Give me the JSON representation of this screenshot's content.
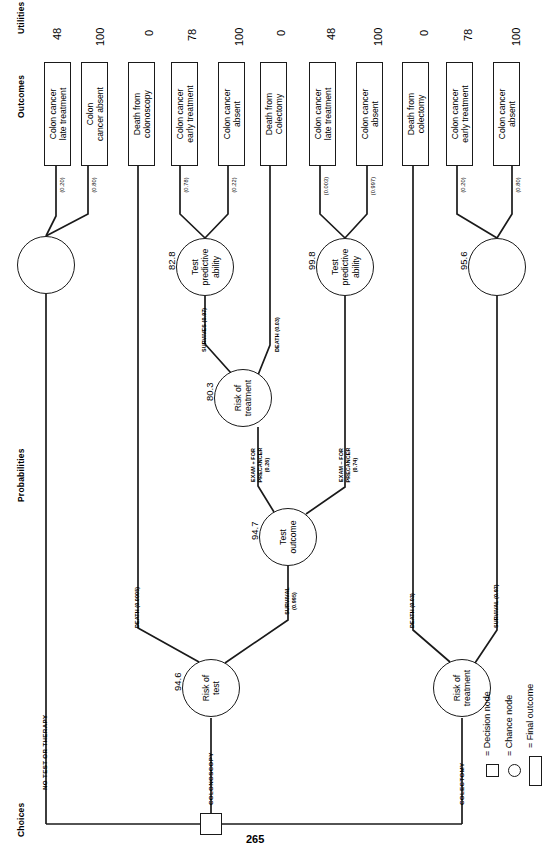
{
  "figure": {
    "page_number": "265",
    "orientation": "rotated-90-landscape",
    "column_headers": {
      "choices": "Choices",
      "probabilities": "Probabilities",
      "outcomes": "Outcomes",
      "utilities": "Utilities"
    }
  },
  "decision_node": {
    "name": "root-decision",
    "branches": [
      {
        "label": "NO TEST OR THERAPY"
      },
      {
        "label": "COLONOSCOPY"
      },
      {
        "label": "COLECTOMY"
      }
    ]
  },
  "chance_nodes": [
    {
      "id": "n1",
      "label": "",
      "value": ""
    },
    {
      "id": "n2",
      "label": "Test\npredictive\nability",
      "value": "82.8"
    },
    {
      "id": "n3",
      "label": "Test\npredictive\nability",
      "value": "99.8"
    },
    {
      "id": "n4",
      "label": "",
      "value": "95.6"
    },
    {
      "id": "n5",
      "label": "Risk of\ntreatment",
      "value": "80.3"
    },
    {
      "id": "n6",
      "label": "Test\noutcome",
      "value": "94.7"
    },
    {
      "id": "n7",
      "label": "Risk of\ntest",
      "value": "94.6"
    },
    {
      "id": "n8",
      "label": "Risk of\ntreatment",
      "value": ""
    }
  ],
  "branch_labels": [
    {
      "id": "b1",
      "text": "(0.20)"
    },
    {
      "id": "b2",
      "text": "(0.80)"
    },
    {
      "id": "b3",
      "text": "(0.78)"
    },
    {
      "id": "b4",
      "text": "(0.22)"
    },
    {
      "id": "b5",
      "text": "(0.003)"
    },
    {
      "id": "b6",
      "text": "(0.997)"
    },
    {
      "id": "b7",
      "text": "(0.20)"
    },
    {
      "id": "b8",
      "text": "(0.80)"
    },
    {
      "id": "b9",
      "text": "SURVIVES (0.97)"
    },
    {
      "id": "b10",
      "text": "DEATH (0.03)"
    },
    {
      "id": "b11",
      "text": "EXAM + FOR\nPRECANCER\n(0.26)"
    },
    {
      "id": "b12",
      "text": "EXAM – FOR\nPRECANCER\n(0.74)"
    },
    {
      "id": "b13",
      "text": "DEATH (0.0005)"
    },
    {
      "id": "b14",
      "text": "SURVIVAL\n(0.995)"
    },
    {
      "id": "b15",
      "text": "DEATH (0.03)"
    },
    {
      "id": "b16",
      "text": "SURVIVAL (0.97)"
    }
  ],
  "outcomes": [
    {
      "id": "o1",
      "text": "Colon cancer\nlate treatment",
      "utility": "48"
    },
    {
      "id": "o2",
      "text": "Colon\ncancer absent",
      "utility": "100"
    },
    {
      "id": "o3",
      "text": "Death from\ncolonoscopy",
      "utility": "0"
    },
    {
      "id": "o4",
      "text": "Colon cancer\nearly treatment",
      "utility": "78"
    },
    {
      "id": "o5",
      "text": "Colon cancer\nabsent",
      "utility": "100"
    },
    {
      "id": "o6",
      "text": "Death from\nColectomy",
      "utility": "0"
    },
    {
      "id": "o7",
      "text": "Colon cancer\nlate treatment",
      "utility": "48"
    },
    {
      "id": "o8",
      "text": "Colon cancer\nabsent",
      "utility": "100"
    },
    {
      "id": "o9",
      "text": "Death from\ncolectomy",
      "utility": "0"
    },
    {
      "id": "o10",
      "text": "Colon cancer\nearly treatment",
      "utility": "78"
    },
    {
      "id": "o11",
      "text": "Colon cancer\nabsent",
      "utility": "100"
    }
  ],
  "legend": {
    "decision": "= Decision node",
    "chance": "= Chance node",
    "outcome": "= Final outcome"
  }
}
